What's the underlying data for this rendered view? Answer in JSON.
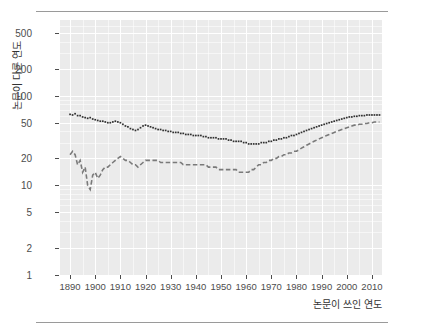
{
  "chart_data": {
    "type": "line",
    "title": "",
    "xlabel": "논문이 쓰인 연도",
    "ylabel": "논문이 다른 연도",
    "xlim": [
      1886,
      2014
    ],
    "ylim": [
      1,
      700
    ],
    "yscale": "log",
    "grid": true,
    "legend": "none",
    "x_ticks": [
      1890,
      1900,
      1910,
      1920,
      1930,
      1940,
      1950,
      1960,
      1970,
      1980,
      1990,
      2000,
      2010
    ],
    "y_ticks": [
      1,
      2,
      5,
      10,
      20,
      50,
      100,
      200,
      500
    ],
    "series": [
      {
        "name": "upper",
        "color": "#303030",
        "style": "dotted-points",
        "x": [
          1890,
          1891,
          1892,
          1893,
          1894,
          1895,
          1896,
          1897,
          1898,
          1899,
          1900,
          1901,
          1902,
          1903,
          1904,
          1905,
          1906,
          1907,
          1908,
          1909,
          1910,
          1911,
          1912,
          1913,
          1914,
          1915,
          1916,
          1917,
          1918,
          1919,
          1920,
          1921,
          1922,
          1923,
          1924,
          1925,
          1926,
          1927,
          1928,
          1929,
          1930,
          1931,
          1932,
          1933,
          1934,
          1935,
          1936,
          1937,
          1938,
          1939,
          1940,
          1941,
          1942,
          1943,
          1944,
          1945,
          1946,
          1947,
          1948,
          1949,
          1950,
          1951,
          1952,
          1953,
          1954,
          1955,
          1956,
          1957,
          1958,
          1959,
          1960,
          1961,
          1962,
          1963,
          1964,
          1965,
          1966,
          1967,
          1968,
          1969,
          1970,
          1971,
          1972,
          1973,
          1974,
          1975,
          1976,
          1977,
          1978,
          1979,
          1980,
          1981,
          1982,
          1983,
          1984,
          1985,
          1986,
          1987,
          1988,
          1989,
          1990,
          1991,
          1992,
          1993,
          1994,
          1995,
          1996,
          1997,
          1998,
          1999,
          2000,
          2001,
          2002,
          2003,
          2004,
          2005,
          2006,
          2007,
          2008,
          2009,
          2010,
          2011,
          2012,
          2013
        ],
        "y": [
          62,
          61,
          63,
          60,
          60,
          58,
          57,
          56,
          57,
          55,
          54,
          53,
          52,
          52,
          51,
          50,
          50,
          51,
          52,
          51,
          50,
          48,
          46,
          45,
          43,
          42,
          41,
          42,
          44,
          46,
          47,
          46,
          45,
          44,
          43,
          42,
          42,
          41,
          41,
          40,
          40,
          39,
          39,
          39,
          38,
          38,
          37,
          37,
          37,
          36,
          36,
          36,
          36,
          35,
          35,
          34,
          34,
          34,
          34,
          33,
          33,
          33,
          33,
          32,
          32,
          31,
          31,
          31,
          31,
          30,
          30,
          29,
          29,
          29,
          29,
          29,
          30,
          30,
          30,
          31,
          31,
          32,
          32,
          33,
          33,
          34,
          34,
          35,
          36,
          36,
          37,
          38,
          39,
          40,
          41,
          42,
          43,
          44,
          45,
          46,
          47,
          48,
          49,
          50,
          51,
          52,
          53,
          54,
          55,
          56,
          57,
          58,
          58,
          59,
          59,
          60,
          60,
          60,
          61,
          61,
          61,
          61,
          61,
          61
        ]
      },
      {
        "name": "lower",
        "color": "#7a7a7a",
        "style": "dashed",
        "x": [
          1890,
          1891,
          1892,
          1893,
          1894,
          1895,
          1896,
          1897,
          1898,
          1899,
          1900,
          1901,
          1902,
          1903,
          1904,
          1905,
          1906,
          1907,
          1908,
          1909,
          1910,
          1911,
          1912,
          1913,
          1914,
          1915,
          1916,
          1917,
          1918,
          1919,
          1920,
          1921,
          1922,
          1923,
          1924,
          1925,
          1926,
          1927,
          1928,
          1929,
          1930,
          1931,
          1932,
          1933,
          1934,
          1935,
          1936,
          1937,
          1938,
          1939,
          1940,
          1941,
          1942,
          1943,
          1944,
          1945,
          1946,
          1947,
          1948,
          1949,
          1950,
          1951,
          1952,
          1953,
          1954,
          1955,
          1956,
          1957,
          1958,
          1959,
          1960,
          1961,
          1962,
          1963,
          1964,
          1965,
          1966,
          1967,
          1968,
          1969,
          1970,
          1971,
          1972,
          1973,
          1974,
          1975,
          1976,
          1977,
          1978,
          1979,
          1980,
          1981,
          1982,
          1983,
          1984,
          1985,
          1986,
          1987,
          1988,
          1989,
          1990,
          1991,
          1992,
          1993,
          1994,
          1995,
          1996,
          1997,
          1998,
          1999,
          2000,
          2001,
          2002,
          2003,
          2004,
          2005,
          2006,
          2007,
          2008,
          2009,
          2010,
          2011,
          2012,
          2013
        ],
        "y": [
          22,
          24,
          22,
          17,
          19,
          14,
          16,
          10,
          9,
          13,
          14,
          12,
          13,
          15,
          16,
          16,
          17,
          18,
          19,
          20,
          21,
          20,
          19,
          19,
          18,
          17,
          17,
          16,
          17,
          18,
          19,
          19,
          19,
          19,
          19,
          19,
          18,
          18,
          18,
          18,
          18,
          18,
          18,
          18,
          18,
          17,
          17,
          17,
          17,
          17,
          17,
          17,
          17,
          17,
          17,
          16,
          16,
          16,
          16,
          15,
          15,
          15,
          15,
          15,
          15,
          15,
          15,
          14,
          14,
          14,
          14,
          14,
          15,
          15,
          16,
          17,
          17,
          18,
          18,
          19,
          19,
          20,
          20,
          21,
          21,
          22,
          22,
          23,
          23,
          24,
          24,
          25,
          26,
          27,
          28,
          29,
          30,
          31,
          32,
          33,
          34,
          35,
          36,
          37,
          38,
          39,
          40,
          41,
          42,
          43,
          44,
          45,
          46,
          47,
          47,
          48,
          48,
          49,
          49,
          50,
          50,
          51,
          51,
          51
        ]
      }
    ]
  }
}
